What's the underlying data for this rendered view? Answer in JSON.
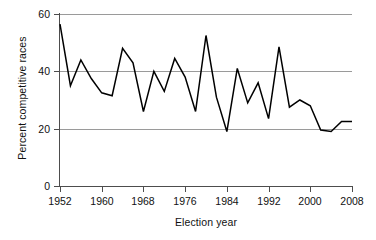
{
  "chart_data": {
    "type": "line",
    "title": "",
    "xlabel": "Election year",
    "ylabel": "Percent competitive races",
    "xlim": [
      1952,
      2008
    ],
    "ylim": [
      0,
      60
    ],
    "xticks": [
      1952,
      1960,
      1968,
      1976,
      1984,
      1992,
      2000,
      2008
    ],
    "xtick_labels": [
      "1952",
      "1960",
      "1968",
      "1976",
      "1984",
      "1992",
      "2000",
      "2008"
    ],
    "yticks": [
      0,
      20,
      40,
      60
    ],
    "ytick_labels": [
      "0",
      "20",
      "40",
      "60"
    ],
    "grid": "horizontal",
    "legend": "none",
    "line_color": "#000000",
    "grid_color": "#9a9a9a",
    "axis_color": "#4d4d4d",
    "x": [
      1952,
      1954,
      1956,
      1958,
      1960,
      1962,
      1964,
      1966,
      1968,
      1970,
      1972,
      1974,
      1976,
      1978,
      1980,
      1982,
      1984,
      1986,
      1988,
      1990,
      1992,
      1994,
      1996,
      1998,
      2000,
      2002,
      2004,
      2006,
      2008
    ],
    "values": [
      56.5,
      35.0,
      44.0,
      37.5,
      32.5,
      31.5,
      48.0,
      43.0,
      26.0,
      40.0,
      33.0,
      44.5,
      38.0,
      26.0,
      52.5,
      31.0,
      19.0,
      41.0,
      29.0,
      36.0,
      23.5,
      48.5,
      27.5,
      30.0,
      28.0,
      19.5,
      19.0,
      22.5,
      22.5
    ],
    "series": [
      {
        "name": "Percent competitive races",
        "values": [
          56.5,
          35.0,
          44.0,
          37.5,
          32.5,
          31.5,
          48.0,
          43.0,
          26.0,
          40.0,
          33.0,
          44.5,
          38.0,
          26.0,
          52.5,
          31.0,
          19.0,
          41.0,
          29.0,
          36.0,
          23.5,
          48.5,
          27.5,
          30.0,
          28.0,
          19.5,
          19.0,
          22.5,
          22.5
        ]
      }
    ]
  }
}
